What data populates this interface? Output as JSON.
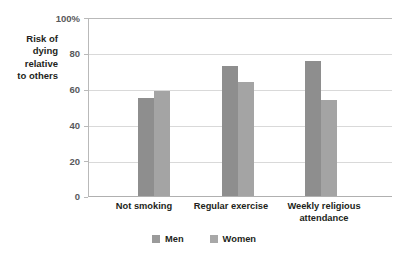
{
  "chart_data": {
    "type": "bar",
    "title": "",
    "xlabel": "",
    "ylabel": "Risk of\ndying\nrelative\nto others",
    "ylim": [
      0,
      100
    ],
    "yticks": [
      "0",
      "20",
      "40",
      "60",
      "80",
      "100%"
    ],
    "grid": true,
    "legend_position": "bottom-center",
    "categories": [
      "Not smoking",
      "Regular exercise",
      "Weekly religious\nattendance"
    ],
    "series": [
      {
        "name": "Men",
        "color": "#8e8e8e",
        "values": [
          55,
          73,
          76
        ]
      },
      {
        "name": "Women",
        "color": "#a4a4a4",
        "values": [
          59,
          64,
          54
        ]
      }
    ]
  },
  "axis": {
    "y_title": "Risk of\ndying\nrelative\nto others",
    "ticks": [
      {
        "label": "100%",
        "value": 100
      },
      {
        "label": "80",
        "value": 80
      },
      {
        "label": "60",
        "value": 60
      },
      {
        "label": "40",
        "value": 40
      },
      {
        "label": "20",
        "value": 20
      },
      {
        "label": "0",
        "value": 0
      }
    ]
  },
  "categories": [
    {
      "label": "Not smoking"
    },
    {
      "label": "Regular exercise"
    },
    {
      "label": "Weekly religious\nattendance"
    }
  ],
  "legend": {
    "items": [
      {
        "label": "Men"
      },
      {
        "label": "Women"
      }
    ]
  }
}
